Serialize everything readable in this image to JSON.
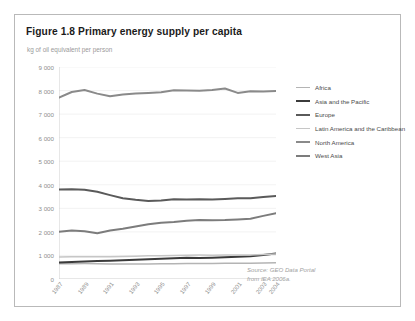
{
  "figure": {
    "title": "Figure 1.8 Primary energy supply per capita",
    "axis_subtitle": "kg of oil equivalent per person",
    "source_line_1": "Source: GEO Data Portal",
    "source_line_2": "from IEA 2006a."
  },
  "chart_data": {
    "type": "line",
    "title": "Figure 1.8 Primary energy supply per capita",
    "subtitle": "kg of oil equivalent per person",
    "xlabel": "",
    "ylabel": "kg of oil equivalent per person",
    "ylim": [
      0,
      9000
    ],
    "ytick_values": [
      0,
      1000,
      2000,
      3000,
      4000,
      5000,
      6000,
      7000,
      8000,
      9000
    ],
    "ytick_labels": [
      "0",
      "1 000",
      "2 000",
      "3 000",
      "4 000",
      "5 000",
      "6 000",
      "7 000",
      "8 000",
      "9 000"
    ],
    "grid": true,
    "grid_axis": "y",
    "legend_position": "right",
    "x": [
      1987,
      1988,
      1989,
      1990,
      1991,
      1992,
      1993,
      1994,
      1995,
      1996,
      1997,
      1998,
      1999,
      2000,
      2001,
      2002,
      2003,
      2004
    ],
    "xtick_labels": [
      "1987",
      "1989",
      "1991",
      "1993",
      "1995",
      "1997",
      "1999",
      "2001",
      "2003",
      "2004"
    ],
    "xtick_values": [
      1987,
      1989,
      1991,
      1993,
      1995,
      1997,
      1999,
      2001,
      2003,
      2004
    ],
    "series": [
      {
        "name": "Africa",
        "color": "#b4b4b4",
        "width": 1.5,
        "values": [
          650,
          652,
          655,
          648,
          640,
          636,
          634,
          638,
          645,
          650,
          655,
          658,
          660,
          665,
          668,
          672,
          678,
          685
        ]
      },
      {
        "name": "Asia and the Pacific",
        "color": "#3b3b3b",
        "width": 2.0,
        "values": [
          700,
          720,
          745,
          762,
          778,
          795,
          815,
          840,
          862,
          885,
          898,
          895,
          905,
          925,
          940,
          965,
          1020,
          1085
        ]
      },
      {
        "name": "Europe",
        "color": "#5a5a5a",
        "width": 2.0,
        "values": [
          3800,
          3805,
          3790,
          3700,
          3560,
          3430,
          3360,
          3310,
          3330,
          3390,
          3375,
          3385,
          3380,
          3400,
          3425,
          3430,
          3480,
          3520
        ]
      },
      {
        "name": "Latin America and the Caribbean",
        "color": "#c6c6c6",
        "width": 1.5,
        "values": [
          930,
          940,
          945,
          942,
          948,
          958,
          968,
          982,
          990,
          1000,
          1012,
          1018,
          1012,
          1020,
          1018,
          1022,
          1035,
          1060
        ]
      },
      {
        "name": "North America",
        "color": "#8a8a8a",
        "width": 2.0,
        "values": [
          7700,
          7940,
          8020,
          7870,
          7760,
          7830,
          7870,
          7900,
          7930,
          8010,
          8000,
          7990,
          8020,
          8090,
          7900,
          7970,
          7960,
          7980
        ]
      },
      {
        "name": "West Asia",
        "color": "#7c7c7c",
        "width": 2.0,
        "values": [
          2010,
          2060,
          2030,
          1940,
          2060,
          2130,
          2230,
          2320,
          2390,
          2420,
          2470,
          2500,
          2490,
          2500,
          2530,
          2560,
          2680,
          2790
        ]
      }
    ]
  }
}
